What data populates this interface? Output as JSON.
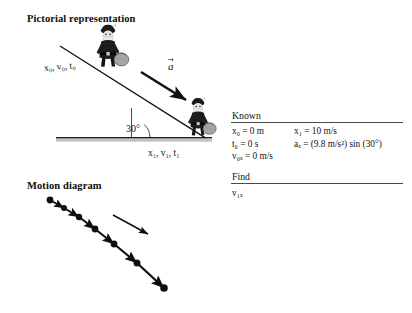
{
  "figure": {
    "pictorial": {
      "heading": "Pictorial representation",
      "initial_state_label": "x₀, v₀, t₀",
      "final_state_label": "x₁, v₁, t₁",
      "angle_label": "30°",
      "acceleration_vector_label": "a",
      "incline_angle_deg": 30,
      "ground_color": "#b9b9b9",
      "line_color": "#141414"
    },
    "motion": {
      "heading": "Motion diagram",
      "velocity_vector_label": "v",
      "acceleration_vector_label": "a",
      "dot_count": 7,
      "dots": [
        {
          "x": 50,
          "y": 200
        },
        {
          "x": 64,
          "y": 208
        },
        {
          "x": 79,
          "y": 217
        },
        {
          "x": 95,
          "y": 229
        },
        {
          "x": 114,
          "y": 244
        },
        {
          "x": 137,
          "y": 263
        },
        {
          "x": 164,
          "y": 288
        }
      ],
      "dot_color": "#0f0f0f"
    },
    "table": {
      "known_title": "Known",
      "known_rows": [
        {
          "left": "x₀ = 0 m",
          "right": "x₁ = 10 m/s"
        },
        {
          "left": "t₀ = 0 s",
          "right": "aₓ = (9.8 m/s²) sin (30°)"
        },
        {
          "left": "v₀ₓ = 0 m/s",
          "right": ""
        }
      ],
      "find_title": "Find",
      "find_items": [
        "v₁ₓ"
      ],
      "rule_color": "#4a4a4a"
    }
  }
}
